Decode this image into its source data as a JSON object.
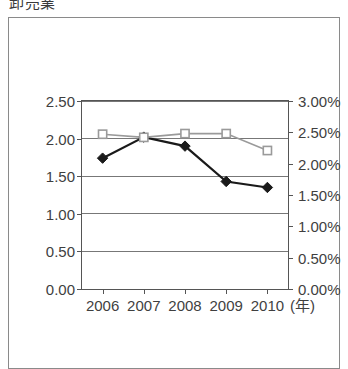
{
  "title": "卸売業",
  "axes": {
    "x_unit_label": "(年)",
    "y_left": {
      "ticks": [
        "0.00",
        "0.50",
        "1.00",
        "1.50",
        "2.00",
        "2.50"
      ],
      "min": 0,
      "max": 2.5
    },
    "y_right": {
      "ticks": [
        "0.00%",
        "0.50%",
        "1.00%",
        "1.50%",
        "2.00%",
        "2.50%",
        "3.00%"
      ],
      "min": 0,
      "max": 3.0
    }
  },
  "colors": {
    "series_black": "#1a1a1a",
    "series_gray": "#9a9a9a",
    "axis": "#555555",
    "grid": "#777777",
    "frame": "#8a8a8a",
    "text": "#3f3f3f"
  },
  "chart_data": {
    "type": "line",
    "title": "卸売業",
    "xlabel": "(年)",
    "ylabel": "",
    "categories": [
      "2006",
      "2007",
      "2008",
      "2009",
      "2010"
    ],
    "x": [
      2006,
      2007,
      2008,
      2009,
      2010
    ],
    "grid": true,
    "legend": "none",
    "axis_left": {
      "label": "",
      "ylim": [
        0,
        2.5
      ],
      "ticks": [
        0.0,
        0.5,
        1.0,
        1.5,
        2.0,
        2.5
      ],
      "tick_labels": [
        "0.00",
        "0.50",
        "1.00",
        "1.50",
        "2.00",
        "2.50"
      ]
    },
    "axis_right": {
      "label": "",
      "ylim": [
        0,
        3.0
      ],
      "ticks": [
        0.0,
        0.5,
        1.0,
        1.5,
        2.0,
        2.5,
        3.0
      ],
      "tick_labels": [
        "0.00%",
        "0.50%",
        "1.00%",
        "1.50%",
        "2.00%",
        "2.50%",
        "3.00%"
      ]
    },
    "series": [
      {
        "name": "series-diamond",
        "axis": "left",
        "marker": "filled-diamond",
        "color": "#1a1a1a",
        "values": [
          1.74,
          2.02,
          1.9,
          1.43,
          1.35
        ]
      },
      {
        "name": "series-square",
        "axis": "right",
        "marker": "open-square",
        "color": "#9a9a9a",
        "values": [
          2.47,
          2.42,
          2.48,
          2.48,
          2.21
        ]
      }
    ]
  }
}
